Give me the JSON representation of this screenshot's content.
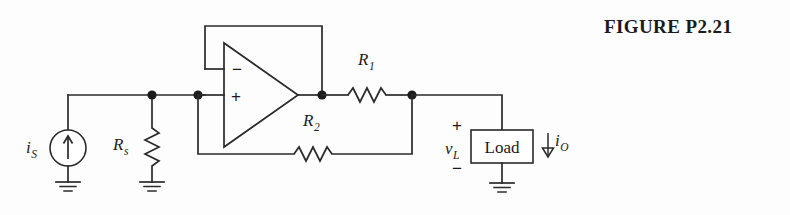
{
  "figure": {
    "caption": "FIGURE P2.21"
  },
  "labels": {
    "source_symbol": "i",
    "source_sub": "S",
    "rs_symbol": "R",
    "rs_sub": "s",
    "r1_symbol": "R",
    "r1_sub": "1",
    "r2_symbol": "R",
    "r2_sub": "2",
    "vload_symbol": "v",
    "vload_sub": "L",
    "iout_symbol": "i",
    "iout_sub": "O",
    "load_box": "Load",
    "opamp_minus": "−",
    "opamp_plus": "+",
    "polarity_plus": "+",
    "polarity_minus": "−"
  },
  "colors": {
    "background": "#fdfdfd",
    "ink": "#2a2a2a",
    "text": "#1b1b1b"
  },
  "circuit": {
    "type": "howland-current-source",
    "components": [
      {
        "name": "current-source",
        "label": "iS",
        "kind": "independent-current-source",
        "orientation": "vertical",
        "arrow": "up"
      },
      {
        "name": "resistor-rs",
        "label": "Rs",
        "kind": "resistor",
        "orientation": "vertical"
      },
      {
        "name": "opamp",
        "kind": "operational-amplifier",
        "inverting_input": "top",
        "noninverting_input": "bottom"
      },
      {
        "name": "resistor-r1",
        "label": "R1",
        "kind": "resistor",
        "orientation": "horizontal"
      },
      {
        "name": "resistor-r2",
        "label": "R2",
        "kind": "resistor",
        "orientation": "horizontal"
      },
      {
        "name": "load",
        "label": "Load",
        "kind": "load-block",
        "orientation": "vertical"
      }
    ],
    "grounds": 4,
    "nodes": 4
  }
}
